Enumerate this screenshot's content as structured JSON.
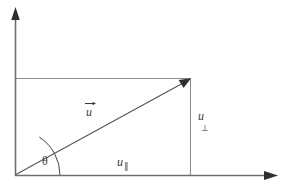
{
  "figure": {
    "kind": "vector-decomposition-diagram",
    "width": 286,
    "height": 188,
    "background_color": "#ffffff",
    "axis_color": "#6e6e6e",
    "rect_color": "#8a8a8a",
    "vector_color": "#555555",
    "arc_color": "#444444",
    "label_color": "#3b3b3b"
  },
  "axes": {
    "origin": {
      "x": 15,
      "y": 175
    },
    "x_axis": {
      "from_x": 15,
      "to_x": 277,
      "y": 175,
      "arrow": "right"
    },
    "y_axis": {
      "x": 15,
      "from_y": 175,
      "to_y": 8,
      "arrow": "up"
    }
  },
  "rectangle": {
    "left": 15,
    "top": 78,
    "right": 191,
    "bottom": 175
  },
  "vector": {
    "name": "u",
    "from": {
      "x": 15,
      "y": 175
    },
    "to": {
      "x": 190,
      "y": 79
    },
    "arrow": "head-at-tip"
  },
  "angle": {
    "symbol": "θ",
    "arc_radius": 45,
    "vertex": {
      "x": 15,
      "y": 175
    }
  },
  "labels": {
    "vector_u": "u",
    "vector_u_arrow": "→",
    "theta": "θ",
    "u_parallel_base": "u",
    "u_parallel_sub": "∥",
    "u_perp_base": "u",
    "u_perp_sub": "⊥"
  }
}
